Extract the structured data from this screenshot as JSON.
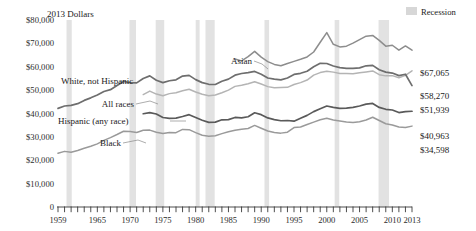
{
  "header": {
    "units_label": "2013 Dollars",
    "legend": {
      "recession_label": "Recession",
      "recession_color": "#d7d7d7"
    }
  },
  "axes": {
    "y_ticks": [
      "$80,000",
      "$70,000",
      "$60,000",
      "$50,000",
      "$40,000",
      "$30,000",
      "$20,000",
      "$10,000"
    ],
    "y_zero": "0",
    "x_ticks": [
      "1959",
      "1965",
      "1970",
      "1975",
      "1980",
      "1985",
      "1990",
      "1995",
      "2000",
      "2005",
      "2010",
      "2013"
    ]
  },
  "annotations": {
    "asian": "Asian",
    "white": "White, not Hispanic",
    "all_races": "All races",
    "hispanic": "Hispanic (any race)",
    "black": "Black"
  },
  "end_labels": {
    "asian": "$67,065",
    "white": "$58,270",
    "all_races": "$51,939",
    "hispanic": "$40,963",
    "black": "$34,598"
  },
  "chart_data": {
    "type": "line",
    "title": "",
    "subtitle": "",
    "xlabel": "",
    "ylabel": "2013 Dollars",
    "xlim": [
      1959,
      2013
    ],
    "ylim": [
      0,
      80000
    ],
    "grid": false,
    "legend_position": "in-plot-labels",
    "x": [
      1959,
      1960,
      1961,
      1962,
      1963,
      1964,
      1965,
      1966,
      1967,
      1968,
      1969,
      1970,
      1971,
      1972,
      1973,
      1974,
      1975,
      1976,
      1977,
      1978,
      1979,
      1980,
      1981,
      1982,
      1983,
      1984,
      1985,
      1986,
      1987,
      1988,
      1989,
      1990,
      1991,
      1992,
      1993,
      1994,
      1995,
      1996,
      1997,
      1998,
      1999,
      2000,
      2001,
      2002,
      2003,
      2004,
      2005,
      2006,
      2007,
      2008,
      2009,
      2010,
      2011,
      2012,
      2013
    ],
    "series": [
      {
        "name": "Asian",
        "color": "#8d8d8d",
        "label_x": 1987,
        "values": [
          null,
          null,
          null,
          null,
          null,
          null,
          null,
          null,
          null,
          null,
          null,
          null,
          null,
          null,
          null,
          null,
          null,
          null,
          null,
          null,
          null,
          null,
          null,
          null,
          null,
          null,
          null,
          63300,
          62500,
          64300,
          66600,
          64100,
          62200,
          61000,
          60400,
          61400,
          62300,
          63200,
          64200,
          66300,
          70500,
          74600,
          69600,
          68500,
          68800,
          70100,
          71600,
          73100,
          73400,
          71300,
          68800,
          69200,
          67100,
          68900,
          67065
        ],
        "end_value": 67065
      },
      {
        "name": "White, not Hispanic",
        "color": "#b4b4b4",
        "label_x": 1966,
        "values": [
          null,
          null,
          null,
          null,
          null,
          null,
          null,
          null,
          null,
          null,
          null,
          null,
          null,
          48100,
          49600,
          48300,
          47600,
          48500,
          48900,
          49700,
          50400,
          49200,
          48200,
          47600,
          47900,
          48900,
          50000,
          51600,
          52100,
          52700,
          53600,
          52600,
          51500,
          51000,
          51100,
          51200,
          52400,
          53200,
          54300,
          56400,
          57500,
          58100,
          57700,
          57100,
          57100,
          57000,
          57400,
          57800,
          58200,
          56600,
          56100,
          56200,
          55300,
          56300,
          58270
        ],
        "end_value": 58270
      },
      {
        "name": "All races",
        "color": "#6e6e6e",
        "label_x": 1971,
        "values": [
          42200,
          43200,
          43500,
          44200,
          45600,
          46700,
          47900,
          49400,
          50200,
          52000,
          53700,
          53200,
          53100,
          55000,
          56100,
          54200,
          53200,
          54000,
          54400,
          56000,
          56300,
          54500,
          53200,
          52500,
          52400,
          53800,
          54700,
          56400,
          57100,
          57500,
          58000,
          56800,
          55200,
          54700,
          54400,
          55200,
          56700,
          57200,
          58100,
          60000,
          61500,
          61400,
          60300,
          59600,
          59300,
          59300,
          59500,
          60400,
          60600,
          58700,
          57700,
          57300,
          56200,
          56800,
          51939
        ],
        "end_value": 51939
      },
      {
        "name": "Hispanic (any race)",
        "color": "#5a5a5a",
        "label_x": 1967,
        "values": [
          null,
          null,
          null,
          null,
          null,
          null,
          null,
          null,
          null,
          null,
          null,
          null,
          null,
          39900,
          40400,
          39800,
          38300,
          37900,
          38000,
          38700,
          39500,
          38300,
          37100,
          36200,
          36300,
          37300,
          37400,
          38300,
          38100,
          38600,
          40300,
          39500,
          38100,
          37400,
          36900,
          37000,
          36700,
          38000,
          39200,
          40800,
          42000,
          43200,
          42600,
          42200,
          42300,
          42600,
          43200,
          44000,
          44300,
          42600,
          41800,
          41500,
          40400,
          40800,
          40963
        ],
        "end_value": 40963
      },
      {
        "name": "Black",
        "color": "#9a9a9a",
        "label_x": 1969,
        "values": [
          23000,
          23800,
          23400,
          24200,
          25100,
          26000,
          27000,
          28500,
          29700,
          31000,
          32400,
          32300,
          31900,
          32800,
          32900,
          32000,
          31400,
          31900,
          31800,
          33200,
          33100,
          31800,
          30700,
          30300,
          30500,
          31400,
          32200,
          32800,
          33300,
          33600,
          34900,
          33700,
          32500,
          31900,
          31600,
          32000,
          34000,
          34200,
          35300,
          36300,
          37300,
          38000,
          37200,
          36800,
          36400,
          36200,
          36500,
          37200,
          38400,
          37000,
          35600,
          35100,
          34200,
          34000,
          34598
        ],
        "end_value": 34598
      }
    ],
    "recessions": [
      {
        "start": 1960.3,
        "end": 1961.1
      },
      {
        "start": 1969.9,
        "end": 1970.9
      },
      {
        "start": 1973.9,
        "end": 1975.2
      },
      {
        "start": 1980.0,
        "end": 1980.6
      },
      {
        "start": 1981.5,
        "end": 1982.9
      },
      {
        "start": 1990.5,
        "end": 1991.2
      },
      {
        "start": 2001.2,
        "end": 2001.9
      },
      {
        "start": 2007.9,
        "end": 2009.5
      }
    ]
  }
}
